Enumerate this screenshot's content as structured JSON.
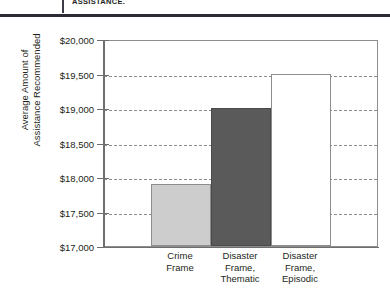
{
  "header": {
    "caption": "ASSISTANCE."
  },
  "chart_data": {
    "type": "bar",
    "title": "",
    "xlabel": "",
    "ylabel": "Average Amount of Assistance Recommended",
    "ylabel_lines": [
      "Average Amount of",
      "Assistance Recommended"
    ],
    "categories": [
      "Crime Frame",
      "Disaster Frame, Thematic",
      "Disaster Frame, Episodic"
    ],
    "category_lines": [
      [
        "Crime",
        "Frame"
      ],
      [
        "Disaster",
        "Frame,",
        "Thematic"
      ],
      [
        "Disaster",
        "Frame,",
        "Episodic"
      ]
    ],
    "values": [
      17900,
      19000,
      19500
    ],
    "ylim": [
      17000,
      20000
    ],
    "ytick_values": [
      20000,
      19500,
      19000,
      18500,
      18000,
      17500,
      17000
    ],
    "ytick_labels": [
      "$20,000",
      "$19,500",
      "$19,000",
      "$18,500",
      "$18,000",
      "$17,500",
      "$17,000"
    ],
    "grid": true,
    "gridlines_at": [
      19500,
      19000,
      18500,
      18000,
      17500
    ],
    "legend": null,
    "bar_colors": [
      "#cdcdcd",
      "#5a5a5a",
      "#ffffff"
    ],
    "bar_border_color": "#8d8d8d"
  }
}
